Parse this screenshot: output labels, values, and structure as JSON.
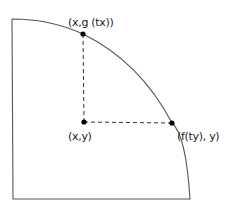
{
  "diagram": {
    "title": "",
    "points": [
      {
        "id": "top",
        "label": "(x,g (tx))"
      },
      {
        "id": "center",
        "label": "(x,y)"
      },
      {
        "id": "right",
        "label": "(f(ty), y)"
      }
    ],
    "colors": {
      "stroke": "#555555",
      "point": "#000000",
      "dashed": "#333333",
      "text": "#1a1a1a"
    }
  }
}
